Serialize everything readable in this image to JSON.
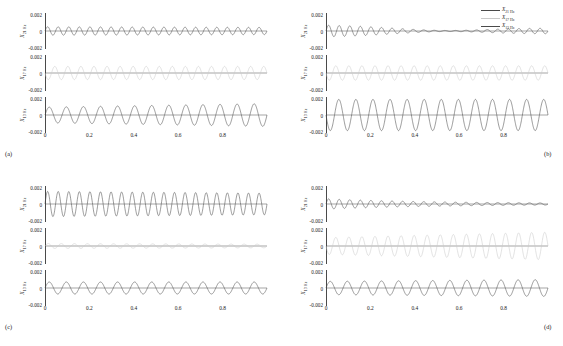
{
  "figure": {
    "panels": [
      {
        "key": "a",
        "label": "(a)"
      },
      {
        "key": "b",
        "label": "(b)"
      },
      {
        "key": "c",
        "label": "(c)"
      },
      {
        "key": "d",
        "label": "(d)"
      }
    ],
    "legend": {
      "position": "top-right of panel (b)",
      "entries": [
        {
          "symbol": "X",
          "subscript": "21 Hz",
          "color": "#4a4a4a"
        },
        {
          "symbol": "X",
          "subscript": "17 Hz",
          "color": "#c9c9c9"
        },
        {
          "symbol": "X",
          "subscript": "13 Hz",
          "color": "#4a4a4a"
        }
      ]
    },
    "axes": {
      "xticks": [
        "0",
        "0.2",
        "0.4",
        "0.6",
        "0.8"
      ],
      "xtick_values": [
        0,
        0.2,
        0.4,
        0.6,
        0.8
      ],
      "yticks": [
        "0.002",
        "0",
        "-0.002"
      ],
      "ytick_values": [
        0.002,
        0,
        -0.002
      ],
      "ylabels": [
        {
          "symbol": "X",
          "subscript": "21 Hz"
        },
        {
          "symbol": "X",
          "subscript": "17 Hz"
        },
        {
          "symbol": "X",
          "subscript": "13 Hz"
        }
      ]
    }
  },
  "chart_data": {
    "type": "line",
    "title": "",
    "xlabel": "",
    "ylabel": "",
    "xlim": [
      0,
      1.0
    ],
    "ylim": [
      -0.003,
      0.003
    ],
    "grid": false,
    "legend_position": "upper right (panel b)",
    "xticks": [
      0,
      0.2,
      0.4,
      0.6,
      0.8
    ],
    "yticks": [
      -0.002,
      0,
      0.002
    ],
    "panels": [
      {
        "panel": "a",
        "series": [
          {
            "name": "X_21Hz",
            "freq_hz": 21,
            "color": "#4a4a4a",
            "amp_start": 0.0007,
            "amp_end": 0.0006,
            "envelope": "flat",
            "phase": 0.0
          },
          {
            "name": "X_17Hz",
            "freq_hz": 17,
            "color": "#c9c9c9",
            "amp_start": 0.0011,
            "amp_end": 0.0011,
            "envelope": "flat",
            "phase": 3.14159
          },
          {
            "name": "X_13Hz",
            "freq_hz": 13,
            "color": "#4a4a4a",
            "amp_start": 0.0013,
            "amp_end": 0.0019,
            "envelope": "slight-rise",
            "phase": 0.0
          }
        ]
      },
      {
        "panel": "b",
        "series": [
          {
            "name": "X_21Hz",
            "freq_hz": 21,
            "color": "#4a4a4a",
            "amp_start": 0.001,
            "amp_end": 0.0005,
            "envelope": "decay-then-revive",
            "phase": 0.0
          },
          {
            "name": "X_17Hz",
            "freq_hz": 17,
            "color": "#c9c9c9",
            "amp_start": 0.0012,
            "amp_end": 0.0012,
            "envelope": "flat",
            "phase": 3.14159
          },
          {
            "name": "X_13Hz",
            "freq_hz": 13,
            "color": "#4a4a4a",
            "amp_start": 0.0026,
            "amp_end": 0.0026,
            "envelope": "flat-large",
            "phase": 3.14159
          }
        ]
      },
      {
        "panel": "c",
        "series": [
          {
            "name": "X_21Hz",
            "freq_hz": 21,
            "color": "#4a4a4a",
            "amp_start": 0.0021,
            "amp_end": 0.0018,
            "envelope": "flat-large",
            "phase": 0.0
          },
          {
            "name": "X_17Hz",
            "freq_hz": 17,
            "color": "#c9c9c9",
            "amp_start": 0.0004,
            "amp_end": 0.0003,
            "envelope": "near-zero",
            "phase": 0.0
          },
          {
            "name": "X_13Hz",
            "freq_hz": 13,
            "color": "#4a4a4a",
            "amp_start": 0.001,
            "amp_end": 0.001,
            "envelope": "flat",
            "phase": 0.0
          }
        ]
      },
      {
        "panel": "d",
        "series": [
          {
            "name": "X_21Hz",
            "freq_hz": 21,
            "color": "#4a4a4a",
            "amp_start": 0.0008,
            "amp_end": 0.0002,
            "envelope": "decay",
            "phase": 0.0
          },
          {
            "name": "X_17Hz",
            "freq_hz": 17,
            "color": "#c9c9c9",
            "amp_start": 0.0014,
            "amp_end": 0.0023,
            "envelope": "rise",
            "phase": 3.14159
          },
          {
            "name": "X_13Hz",
            "freq_hz": 13,
            "color": "#4a4a4a",
            "amp_start": 0.0011,
            "amp_end": 0.0014,
            "envelope": "slight-rise",
            "phase": 0.0
          }
        ]
      }
    ]
  }
}
